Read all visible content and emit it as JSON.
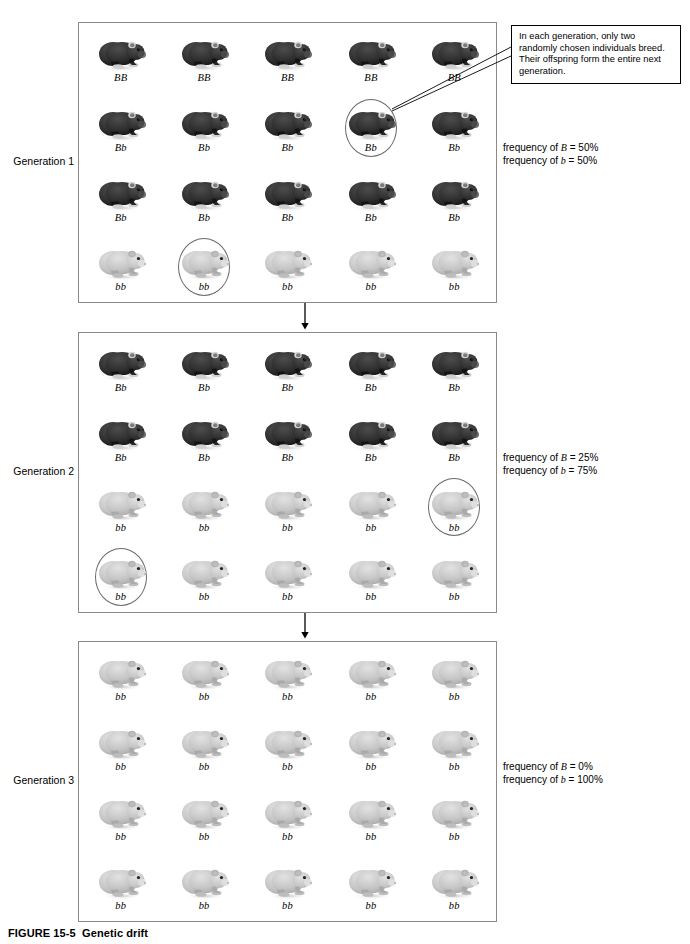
{
  "figure": {
    "caption_label": "FIGURE 15-5",
    "caption_title": "Genetic drift"
  },
  "callout": {
    "text": "In each generation, only two randomly chosen individuals breed. Their offspring form the entire next generation."
  },
  "generations": [
    {
      "id": "generation-1",
      "label": "Generation 1",
      "freq_dominant": "frequency of B = 50%",
      "freq_recessive": "frequency of b = 50%",
      "freq_dominant_prefix": "frequency of ",
      "freq_dominant_allele": "B",
      "freq_dominant_value": " = 50%",
      "freq_recessive_prefix": "frequency of ",
      "freq_recessive_allele": "b",
      "freq_recessive_value": " = 50%",
      "rows": [
        [
          {
            "genotype": "BB",
            "coat": "dark",
            "chosen": false
          },
          {
            "genotype": "BB",
            "coat": "dark",
            "chosen": false
          },
          {
            "genotype": "BB",
            "coat": "dark",
            "chosen": false
          },
          {
            "genotype": "BB",
            "coat": "dark",
            "chosen": false
          },
          {
            "genotype": "BB",
            "coat": "dark",
            "chosen": false
          }
        ],
        [
          {
            "genotype": "Bb",
            "coat": "dark",
            "chosen": false
          },
          {
            "genotype": "Bb",
            "coat": "dark",
            "chosen": false
          },
          {
            "genotype": "Bb",
            "coat": "dark",
            "chosen": false
          },
          {
            "genotype": "Bb",
            "coat": "dark",
            "chosen": true
          },
          {
            "genotype": "Bb",
            "coat": "dark",
            "chosen": false
          }
        ],
        [
          {
            "genotype": "Bb",
            "coat": "dark",
            "chosen": false
          },
          {
            "genotype": "Bb",
            "coat": "dark",
            "chosen": false
          },
          {
            "genotype": "Bb",
            "coat": "dark",
            "chosen": false
          },
          {
            "genotype": "Bb",
            "coat": "dark",
            "chosen": false
          },
          {
            "genotype": "Bb",
            "coat": "dark",
            "chosen": false
          }
        ],
        [
          {
            "genotype": "bb",
            "coat": "light",
            "chosen": false
          },
          {
            "genotype": "bb",
            "coat": "light",
            "chosen": true
          },
          {
            "genotype": "bb",
            "coat": "light",
            "chosen": false
          },
          {
            "genotype": "bb",
            "coat": "light",
            "chosen": false
          },
          {
            "genotype": "bb",
            "coat": "light",
            "chosen": false
          }
        ]
      ]
    },
    {
      "id": "generation-2",
      "label": "Generation 2",
      "freq_dominant_prefix": "frequency of ",
      "freq_dominant_allele": "B",
      "freq_dominant_value": " = 25%",
      "freq_recessive_prefix": "frequency of ",
      "freq_recessive_allele": "b",
      "freq_recessive_value": " = 75%",
      "rows": [
        [
          {
            "genotype": "Bb",
            "coat": "dark",
            "chosen": false
          },
          {
            "genotype": "Bb",
            "coat": "dark",
            "chosen": false
          },
          {
            "genotype": "Bb",
            "coat": "dark",
            "chosen": false
          },
          {
            "genotype": "Bb",
            "coat": "dark",
            "chosen": false
          },
          {
            "genotype": "Bb",
            "coat": "dark",
            "chosen": false
          }
        ],
        [
          {
            "genotype": "Bb",
            "coat": "dark",
            "chosen": false
          },
          {
            "genotype": "Bb",
            "coat": "dark",
            "chosen": false
          },
          {
            "genotype": "Bb",
            "coat": "dark",
            "chosen": false
          },
          {
            "genotype": "Bb",
            "coat": "dark",
            "chosen": false
          },
          {
            "genotype": "Bb",
            "coat": "dark",
            "chosen": false
          }
        ],
        [
          {
            "genotype": "bb",
            "coat": "light",
            "chosen": false
          },
          {
            "genotype": "bb",
            "coat": "light",
            "chosen": false
          },
          {
            "genotype": "bb",
            "coat": "light",
            "chosen": false
          },
          {
            "genotype": "bb",
            "coat": "light",
            "chosen": false
          },
          {
            "genotype": "bb",
            "coat": "light",
            "chosen": true
          }
        ],
        [
          {
            "genotype": "bb",
            "coat": "light",
            "chosen": true
          },
          {
            "genotype": "bb",
            "coat": "light",
            "chosen": false
          },
          {
            "genotype": "bb",
            "coat": "light",
            "chosen": false
          },
          {
            "genotype": "bb",
            "coat": "light",
            "chosen": false
          },
          {
            "genotype": "bb",
            "coat": "light",
            "chosen": false
          }
        ]
      ]
    },
    {
      "id": "generation-3",
      "label": "Generation 3",
      "freq_dominant_prefix": "frequency of ",
      "freq_dominant_allele": "B",
      "freq_dominant_value": " = 0%",
      "freq_recessive_prefix": "frequency of ",
      "freq_recessive_allele": "b",
      "freq_recessive_value": " = 100%",
      "rows": [
        [
          {
            "genotype": "bb",
            "coat": "light",
            "chosen": false
          },
          {
            "genotype": "bb",
            "coat": "light",
            "chosen": false
          },
          {
            "genotype": "bb",
            "coat": "light",
            "chosen": false
          },
          {
            "genotype": "bb",
            "coat": "light",
            "chosen": false
          },
          {
            "genotype": "bb",
            "coat": "light",
            "chosen": false
          }
        ],
        [
          {
            "genotype": "bb",
            "coat": "light",
            "chosen": false
          },
          {
            "genotype": "bb",
            "coat": "light",
            "chosen": false
          },
          {
            "genotype": "bb",
            "coat": "light",
            "chosen": false
          },
          {
            "genotype": "bb",
            "coat": "light",
            "chosen": false
          },
          {
            "genotype": "bb",
            "coat": "light",
            "chosen": false
          }
        ],
        [
          {
            "genotype": "bb",
            "coat": "light",
            "chosen": false
          },
          {
            "genotype": "bb",
            "coat": "light",
            "chosen": false
          },
          {
            "genotype": "bb",
            "coat": "light",
            "chosen": false
          },
          {
            "genotype": "bb",
            "coat": "light",
            "chosen": false
          },
          {
            "genotype": "bb",
            "coat": "light",
            "chosen": false
          }
        ],
        [
          {
            "genotype": "bb",
            "coat": "light",
            "chosen": false
          },
          {
            "genotype": "bb",
            "coat": "light",
            "chosen": false
          },
          {
            "genotype": "bb",
            "coat": "light",
            "chosen": false
          },
          {
            "genotype": "bb",
            "coat": "light",
            "chosen": false
          },
          {
            "genotype": "bb",
            "coat": "light",
            "chosen": false
          }
        ]
      ]
    }
  ],
  "colors": {
    "dark_coat": "#2b2b2b",
    "light_coat": "#c9c9c9",
    "panel_border": "#8a8a8a",
    "circle_stroke": "#6a6a6a",
    "arrow": "#000000"
  },
  "icons": {
    "dark_animal": "dark-rodent-icon",
    "light_animal": "light-rodent-icon",
    "arrow": "down-arrow-icon"
  }
}
